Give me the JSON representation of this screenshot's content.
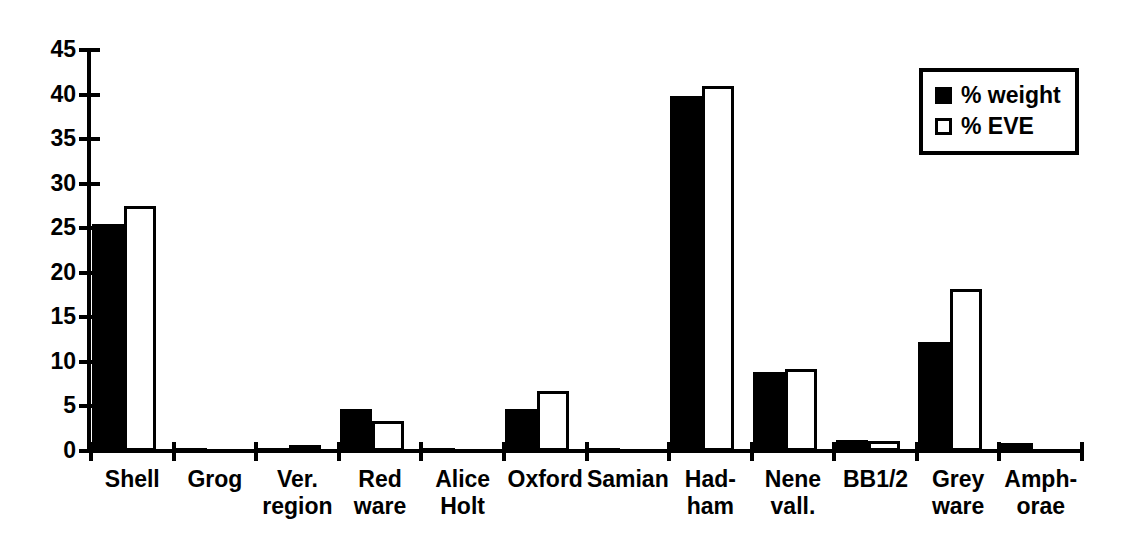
{
  "chart_data": {
    "type": "bar",
    "title": "",
    "subtitle": "",
    "xlabel": "",
    "ylabel": "",
    "ylim": [
      0,
      45
    ],
    "yticks": [
      0,
      5,
      10,
      15,
      20,
      25,
      30,
      35,
      40,
      45
    ],
    "grid": false,
    "legend_position": "top-right",
    "categories": [
      "Shell",
      "Grog",
      "Ver.\nregion",
      "Red\nware",
      "Alice\nHolt",
      "Oxford",
      "Samian",
      "Had-\nham",
      "Nene\nvall.",
      "BB1/2",
      "Grey\nware",
      "Amph-\norae"
    ],
    "series": [
      {
        "name": "% weight",
        "color": "#000000",
        "style": "filled",
        "values": [
          25.5,
          0.2,
          0.2,
          4.7,
          0.25,
          4.7,
          0.2,
          39.8,
          8.9,
          1.2,
          12.2,
          0.9
        ]
      },
      {
        "name": "% EVE",
        "color": "#ffffff",
        "style": "outlined",
        "values": [
          27.5,
          0,
          0.2,
          3.4,
          0,
          6.7,
          0,
          41.0,
          9.2,
          1.1,
          18.2,
          0
        ]
      }
    ]
  },
  "legend": {
    "items": [
      {
        "label": "% weight",
        "swatch": "filled-square-icon"
      },
      {
        "label": "% EVE",
        "swatch": "outlined-square-icon"
      }
    ]
  }
}
